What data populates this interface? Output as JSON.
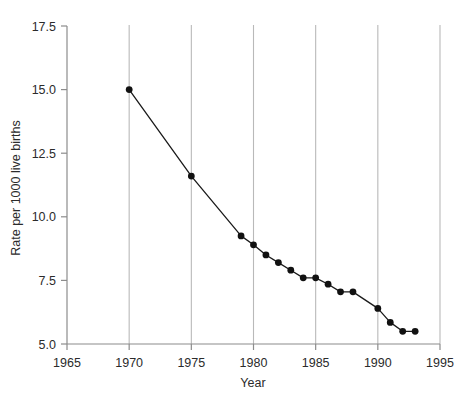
{
  "chart_data": {
    "type": "line",
    "title": "",
    "xlabel": "Year",
    "ylabel": "Rate per 1000 live births",
    "xlim": [
      1965,
      1995
    ],
    "ylim": [
      5.0,
      17.5
    ],
    "grid": "vertical",
    "legend": "none",
    "x_ticks": [
      "1965",
      "1970",
      "1975",
      "1980",
      "1985",
      "1990",
      "1995"
    ],
    "x_tick_values": [
      1965,
      1970,
      1975,
      1980,
      1985,
      1990,
      1995
    ],
    "y_ticks": [
      "5.0",
      "7.5",
      "10.0",
      "12.5",
      "15.0",
      "17.5"
    ],
    "y_tick_values": [
      5.0,
      7.5,
      10.0,
      12.5,
      15.0,
      17.5
    ],
    "gridline_values": [
      1970,
      1975,
      1980,
      1985,
      1990,
      1995
    ],
    "series": [
      {
        "name": "Infant mortality rate",
        "x": [
          1970,
          1975,
          1979,
          1980,
          1981,
          1982,
          1983,
          1984,
          1985,
          1986,
          1987,
          1988,
          1990,
          1991,
          1992,
          1993
        ],
        "values": [
          15.0,
          11.6,
          9.25,
          8.9,
          8.5,
          8.2,
          7.9,
          7.6,
          7.6,
          7.35,
          7.05,
          7.05,
          6.4,
          5.85,
          5.5,
          5.5
        ],
        "marker": "filled-circle",
        "color": "#111111"
      }
    ]
  },
  "colors": {
    "line": "#111111",
    "marker": "#111111",
    "grid": "#b9b9b9",
    "axis": "#8c8c8c",
    "text": "#2b2b2b",
    "background": "#ffffff"
  },
  "axis_titles": {
    "x": "Year",
    "y": "Rate per 1000 live births"
  }
}
